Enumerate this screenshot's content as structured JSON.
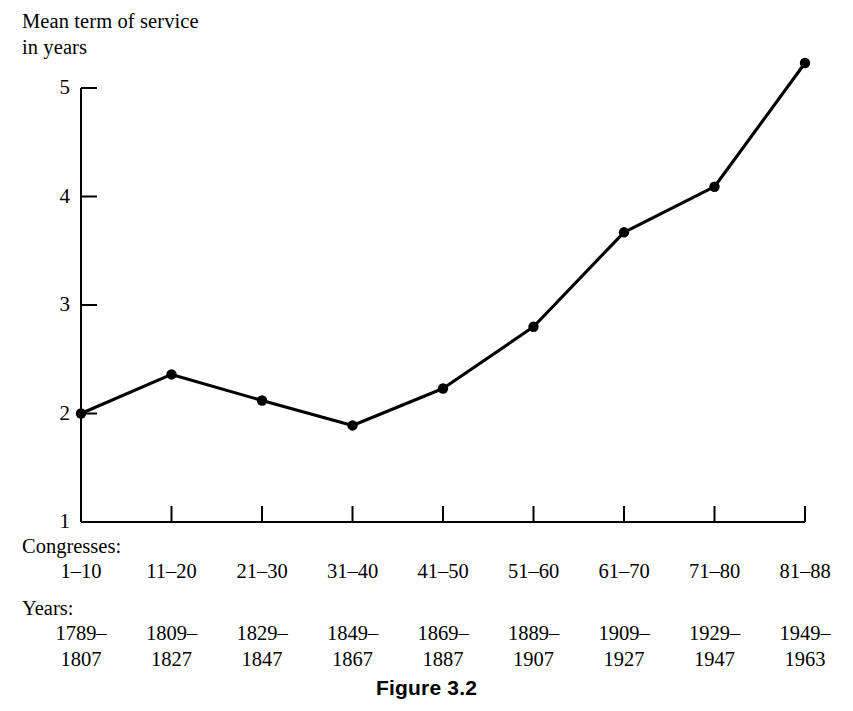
{
  "figure": {
    "caption": "Figure 3.2",
    "y_axis_title": "Mean term of service\nin years",
    "congresses_heading": "Congresses:",
    "years_heading": "Years:"
  },
  "axis": {
    "y_ticks": [
      "5",
      "4",
      "3",
      "2",
      "1"
    ],
    "y_tick_values": [
      5,
      4,
      3,
      2,
      1
    ]
  },
  "chart_data": {
    "type": "line",
    "title": "Figure 3.2",
    "xlabel": "Congresses / Years",
    "ylabel": "Mean term of service in years",
    "ylim": [
      1,
      5
    ],
    "grid": false,
    "legend": "none",
    "marker": "filled-circle",
    "line_color": "#000000",
    "categories": [
      "1-10",
      "11-20",
      "21-30",
      "31-40",
      "41-50",
      "51-60",
      "61-70",
      "71-80",
      "81-88"
    ],
    "x_tick_labels_congresses": [
      "1–10",
      "11–20",
      "21–30",
      "31–40",
      "41–50",
      "51–60",
      "61–70",
      "71–80",
      "81–88"
    ],
    "x_tick_labels_years_line1": [
      "1789–",
      "1809–",
      "1829–",
      "1849–",
      "1869–",
      "1889–",
      "1909–",
      "1929–",
      "1949–"
    ],
    "x_tick_labels_years_line2": [
      "1807",
      "1827",
      "1847",
      "1867",
      "1887",
      "1907",
      "1927",
      "1947",
      "1963"
    ],
    "values": [
      2.0,
      2.36,
      2.12,
      1.89,
      2.23,
      2.8,
      3.67,
      4.09,
      5.23
    ],
    "ytick_labels": [
      "1",
      "2",
      "3",
      "4",
      "5"
    ],
    "ytick_values": [
      1,
      2,
      3,
      4,
      5
    ]
  }
}
